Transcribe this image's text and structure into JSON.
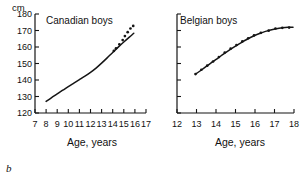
{
  "figure": {
    "unit_label": "cm",
    "panels": [
      {
        "letter": "b",
        "title": "Canadian boys",
        "xlabel": "Age, years",
        "ylabel": "cm",
        "xticks": [
          7,
          8,
          9,
          10,
          11,
          12,
          13,
          14,
          15,
          16,
          17
        ],
        "yticks": [
          120,
          130,
          140,
          150,
          160,
          170,
          180
        ],
        "show_ytick_labels": true,
        "xlim": [
          7,
          17
        ],
        "ylim": [
          120,
          180
        ]
      },
      {
        "letter": "c",
        "title": "Belgian boys",
        "xlabel": "Age, years",
        "ylabel": "",
        "xticks": [
          12,
          13,
          14,
          15,
          16,
          17,
          18
        ],
        "yticks": [
          120,
          130,
          140,
          150,
          160,
          170,
          180
        ],
        "show_ytick_labels": false,
        "xlim": [
          12,
          18
        ],
        "ylim": [
          120,
          180
        ]
      }
    ]
  },
  "chart_data": [
    {
      "type": "line",
      "title": "Canadian boys",
      "xlabel": "Age, years",
      "ylabel": "cm",
      "xlim": [
        7,
        17
      ],
      "ylim": [
        120,
        180
      ],
      "xticks": [
        7,
        8,
        9,
        10,
        11,
        12,
        13,
        14,
        15,
        16,
        17
      ],
      "yticks": [
        120,
        130,
        140,
        150,
        160,
        170,
        180
      ],
      "grid": false,
      "legend": "none",
      "series": [
        {
          "name": "fitted curve",
          "style": "solid",
          "x": [
            8.0,
            8.5,
            9.0,
            9.5,
            10.0,
            10.5,
            11.0,
            11.5,
            12.0,
            12.5,
            13.0,
            13.5,
            14.0,
            14.5,
            15.0,
            15.5,
            15.9
          ],
          "values": [
            127.0,
            129.3,
            131.6,
            133.8,
            136.0,
            138.1,
            140.2,
            142.3,
            144.6,
            147.2,
            150.2,
            153.4,
            156.7,
            159.9,
            163.0,
            166.0,
            168.3
          ]
        },
        {
          "name": "observed points",
          "style": "dots",
          "x": [
            14.1,
            14.3,
            14.6,
            14.9,
            15.1,
            15.35,
            15.6,
            15.85
          ],
          "values": [
            157.6,
            159.2,
            161.6,
            164.2,
            166.6,
            169.0,
            171.2,
            172.8
          ]
        }
      ]
    },
    {
      "type": "line",
      "title": "Belgian boys",
      "xlabel": "Age, years",
      "ylabel": "",
      "xlim": [
        12,
        18
      ],
      "ylim": [
        120,
        180
      ],
      "xticks": [
        12,
        13,
        14,
        15,
        16,
        17,
        18
      ],
      "yticks": [
        120,
        130,
        140,
        150,
        160,
        170,
        180
      ],
      "grid": false,
      "legend": "none",
      "series": [
        {
          "name": "fitted curve",
          "style": "solid",
          "x": [
            12.95,
            13.2,
            13.5,
            13.8,
            14.1,
            14.4,
            14.7,
            15.0,
            15.3,
            15.6,
            15.9,
            16.2,
            16.5,
            16.8,
            17.1,
            17.4,
            17.7,
            17.95
          ],
          "values": [
            143.5,
            145.6,
            148.2,
            150.8,
            153.3,
            155.8,
            158.2,
            160.5,
            162.7,
            164.7,
            166.5,
            168.0,
            169.3,
            170.3,
            171.1,
            171.6,
            171.9,
            172.0
          ]
        },
        {
          "name": "observed points",
          "style": "dots",
          "x": [
            12.95,
            13.25,
            13.55,
            13.85,
            14.15,
            14.45,
            14.75,
            15.05,
            15.35,
            15.65,
            15.95,
            16.3,
            16.7,
            17.05,
            17.4,
            17.75
          ],
          "values": [
            143.6,
            146.2,
            148.7,
            151.2,
            153.9,
            156.6,
            159.0,
            161.2,
            163.4,
            165.3,
            167.0,
            168.6,
            169.9,
            171.2,
            171.6,
            171.8
          ]
        }
      ]
    }
  ]
}
